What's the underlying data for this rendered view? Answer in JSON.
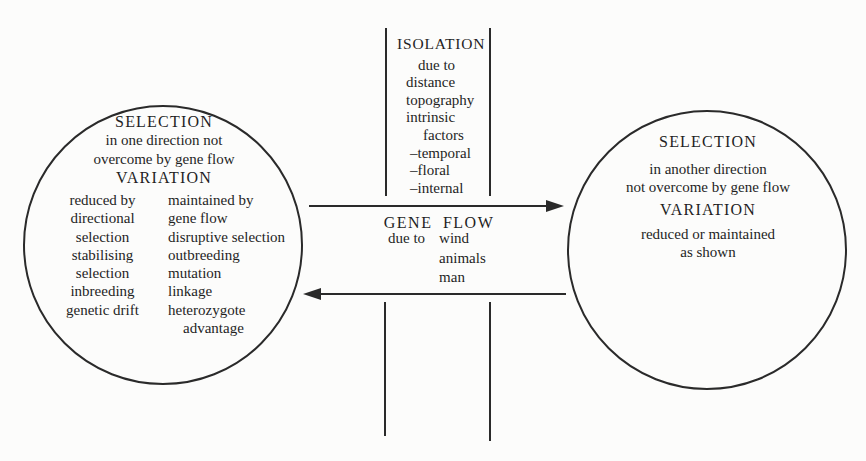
{
  "colors": {
    "ink": "#2a2a2a",
    "background": "#fcfcfb"
  },
  "left_circle": {
    "selection_title": "SELECTION",
    "selection_desc_1": "in one direction not",
    "selection_desc_2": "overcome by gene flow",
    "variation_title": "VARIATION",
    "reduced_column": [
      "reduced by",
      "directional",
      "selection",
      "stabilising",
      "selection",
      "inbreeding",
      "genetic drift"
    ],
    "maintained_column": [
      "maintained by",
      "gene flow",
      "disruptive selection",
      "outbreeding",
      "mutation",
      "linkage",
      "heterozygote",
      "advantage"
    ]
  },
  "right_circle": {
    "selection_title": "SELECTION",
    "selection_desc_1": "in another direction",
    "selection_desc_2": "not overcome by gene flow",
    "variation_title": "VARIATION",
    "variation_desc_1": "reduced or maintained",
    "variation_desc_2": "as shown"
  },
  "isolation": {
    "title": "ISOLATION",
    "lines": [
      "due to",
      "distance",
      "topography",
      "intrinsic",
      "factors",
      "–temporal",
      "–floral",
      "–internal"
    ]
  },
  "gene_flow": {
    "title": "GENE FLOW",
    "due_to_label": "due to",
    "causes": [
      "wind",
      "animals",
      "man"
    ]
  }
}
